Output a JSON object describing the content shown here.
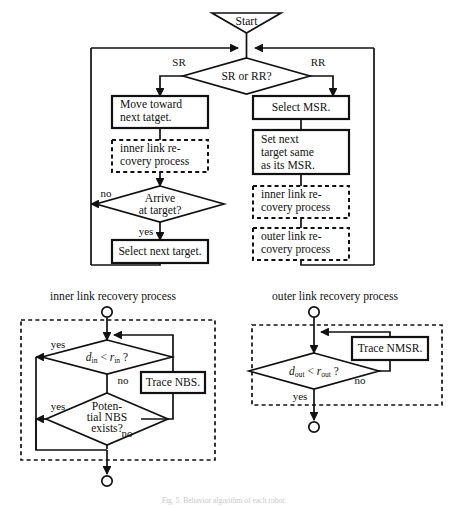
{
  "figure": {
    "caption": "Fig. 5. Behavior algorithm of each robot.",
    "sections": {
      "inner_label": "inner link recovery process",
      "outer_label": "outer link recovery process"
    }
  },
  "main_flow": {
    "start": "Start",
    "decision_sr_rr": "SR or RR?",
    "edge_sr": "SR",
    "edge_rr": "RR",
    "left_branch": {
      "move_line1": "Move toward",
      "move_line2": "next tatget.",
      "inner_proc_line1": "inner link re-",
      "inner_proc_line2": "covery process",
      "arrive_line1": "Arrive",
      "arrive_line2": "at target?",
      "edge_no": "no",
      "edge_yes": "yes",
      "select_next": "Select next target."
    },
    "right_branch": {
      "select_msr": "Select MSR.",
      "set_next_line1": "Set next",
      "set_next_line2": "target same",
      "set_next_line3": "as its MSR.",
      "inner_proc_line1": "inner link re-",
      "inner_proc_line2": "covery process",
      "outer_proc_line1": "outer link re-",
      "outer_proc_line2": "covery process"
    }
  },
  "inner_process": {
    "title": "inner link recovery process",
    "decision_d": "d",
    "decision_d_sub": "in",
    "decision_op": " < ",
    "decision_r": "r",
    "decision_r_sub": "in",
    "decision_q": " ?",
    "edge_yes_1": "yes",
    "edge_no_1": "no",
    "trace_nbs": "Trace NBS.",
    "potential_line1": "Poten-",
    "potential_line2": "tial NBS",
    "potential_line3": "exists?",
    "edge_yes_2": "yes",
    "edge_no_2": "no"
  },
  "outer_process": {
    "title": "outer link recovery process",
    "decision_d": "d",
    "decision_d_sub": "out",
    "decision_op": " < ",
    "decision_r": "r",
    "decision_r_sub": "out",
    "decision_q": " ?",
    "edge_no": "no",
    "edge_yes": "yes",
    "trace_nmsr": "Trace NMSR."
  },
  "colors": {
    "stroke": "#111111",
    "background": "#ffffff"
  }
}
